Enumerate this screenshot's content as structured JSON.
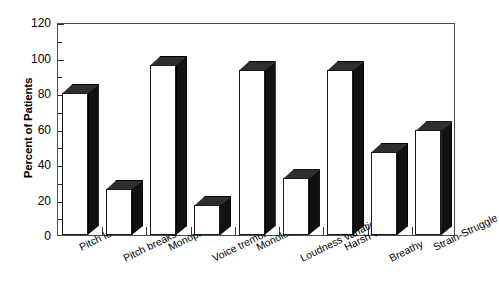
{
  "chart_data": {
    "type": "bar",
    "title": "",
    "xlabel": "",
    "ylabel": "Percent of Patients",
    "ylim": [
      0,
      120
    ],
    "ytick_labels": [
      "0",
      "20",
      "40",
      "60",
      "80",
      "100",
      "120"
    ],
    "ytick_values": [
      0,
      20,
      40,
      60,
      80,
      100,
      120
    ],
    "yminor_values": [
      10,
      30,
      50,
      70,
      90,
      110
    ],
    "grid": false,
    "legend": false,
    "style": "3d-bar",
    "categories": [
      "Pitch level",
      "Pitch breaks",
      "Monopitch",
      "Voice tremor",
      "Monoloudness",
      "Loudness variation",
      "Harsh voice",
      "Breathy",
      "Strain-Struggle"
    ],
    "values": [
      80,
      26,
      96,
      17,
      93,
      32,
      93,
      47,
      59
    ],
    "colors": {
      "bar_face": "#ffffff",
      "bar_side": "#111111",
      "bar_top": "#2e2e2e",
      "axis": "#2b2b2b",
      "frame": "#4c4c4c",
      "text": "#000000"
    }
  },
  "caption": ""
}
